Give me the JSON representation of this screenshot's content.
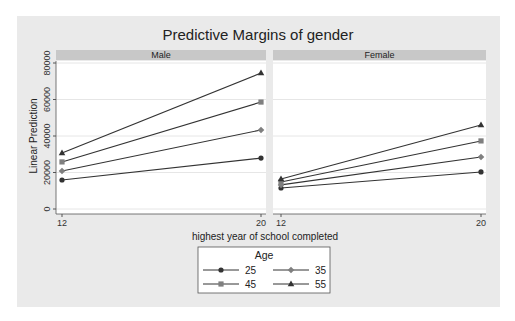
{
  "chart_data": {
    "type": "line",
    "title": "Predictive Margins of gender",
    "xlabel": "highest year of school completed",
    "ylabel": "Linear Prediction",
    "x": [
      12,
      20
    ],
    "x_ticks": [
      "12",
      "20"
    ],
    "y_ticks": [
      "0",
      "20000",
      "40000",
      "60000",
      "80000"
    ],
    "ylim": [
      0,
      80000
    ],
    "grid": true,
    "legend": {
      "title": "Age",
      "position": "bottom",
      "entries": [
        "25",
        "35",
        "45",
        "55"
      ]
    },
    "panels": [
      {
        "name": "Male",
        "series": [
          {
            "name": "25",
            "marker": "circle",
            "values": [
              15900,
              27900
            ]
          },
          {
            "name": "35",
            "marker": "diamond",
            "values": [
              20800,
              43300
            ]
          },
          {
            "name": "45",
            "marker": "square",
            "values": [
              25800,
              58600
            ]
          },
          {
            "name": "55",
            "marker": "triangle",
            "values": [
              30700,
              74500
            ]
          }
        ]
      },
      {
        "name": "Female",
        "series": [
          {
            "name": "25",
            "marker": "circle",
            "values": [
              11500,
              20300
            ]
          },
          {
            "name": "35",
            "marker": "diamond",
            "values": [
              13200,
              28500
            ]
          },
          {
            "name": "45",
            "marker": "square",
            "values": [
              14800,
              37300
            ]
          },
          {
            "name": "55",
            "marker": "triangle",
            "values": [
              16400,
              46000
            ]
          }
        ]
      }
    ]
  },
  "colors": {
    "background": "#eaeaea",
    "plot": "#ffffff",
    "strip": "#c8c8c8",
    "grid": "#e6e6e6",
    "line": "#333333",
    "marker_dark": "#333333",
    "marker_gray": "#7f7f7f"
  }
}
